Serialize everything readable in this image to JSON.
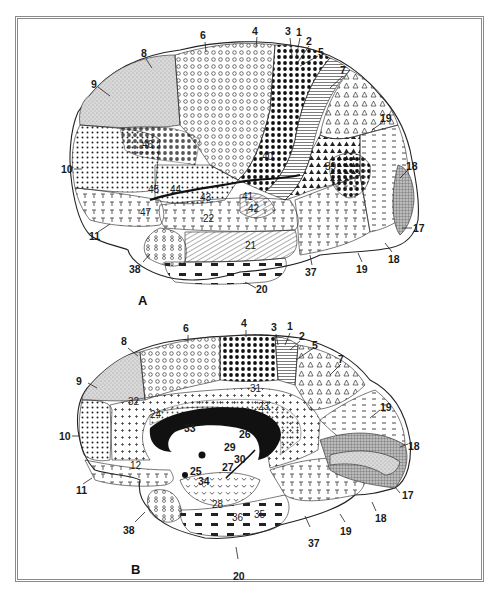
{
  "figure": {
    "panels": [
      {
        "id": "A",
        "view": "lateral",
        "panel_label": "A",
        "outer_labels": [
          "6",
          "4",
          "3",
          "1",
          "2",
          "5",
          "8",
          "7",
          "9",
          "19",
          "10",
          "18",
          "17",
          "11",
          "18",
          "38",
          "37",
          "19",
          "20"
        ],
        "region_labels": [
          "46",
          "45",
          "44",
          "43",
          "40",
          "39",
          "41",
          "42",
          "22",
          "21",
          "47"
        ]
      },
      {
        "id": "B",
        "view": "medial",
        "panel_label": "B",
        "outer_labels": [
          "6",
          "4",
          "3",
          "1",
          "2",
          "5",
          "8",
          "7",
          "9",
          "19",
          "10",
          "18",
          "17",
          "11",
          "18",
          "38",
          "37",
          "19",
          "20"
        ],
        "region_labels": [
          "33",
          "26",
          "29",
          "30",
          "25",
          "27",
          "34",
          "32",
          "31",
          "23",
          "24",
          "12",
          "28",
          "36",
          "35"
        ]
      }
    ]
  },
  "colors": {
    "frame": "#8a8a8a",
    "background": "#ffffff",
    "ink": "#1a1a1a",
    "shade_light": "#d9d9d9",
    "shade_mid": "#a8a8a8"
  }
}
